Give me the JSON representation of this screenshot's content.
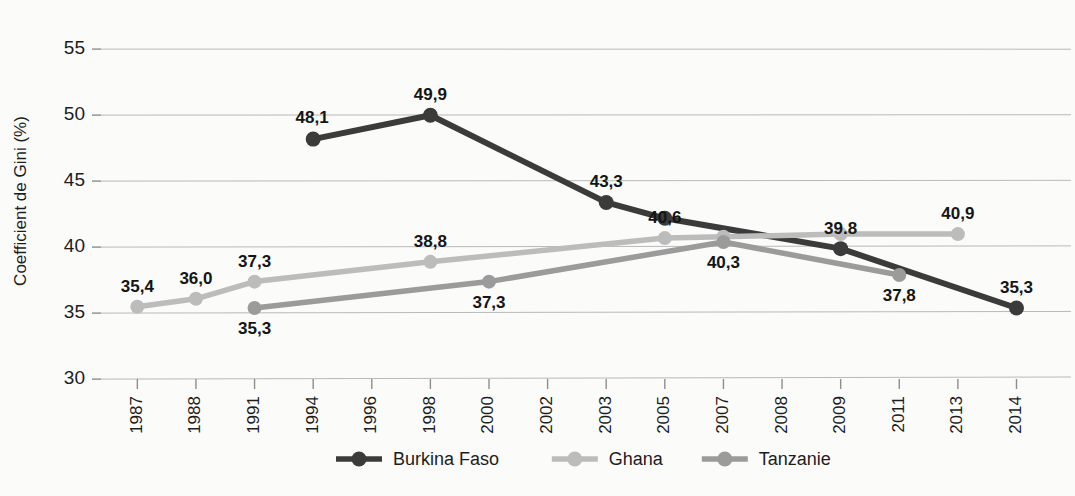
{
  "chart_data": {
    "type": "line",
    "title": "",
    "xlabel": "",
    "ylabel": "Coefficient de Gini (%)",
    "ylim": [
      30,
      55
    ],
    "yticks": [
      30,
      35,
      40,
      45,
      50,
      55
    ],
    "grid": true,
    "legend_position": "bottom",
    "categories": [
      "1987",
      "1988",
      "1991",
      "1994",
      "1996",
      "1998",
      "2000",
      "2002",
      "2003",
      "2005",
      "2007",
      "2008",
      "2009",
      "2011",
      "2013",
      "2014"
    ],
    "series": [
      {
        "name": "Burkina Faso",
        "color": "#3b3b3b",
        "points": [
          {
            "x": "1994",
            "y": 48.1,
            "label": "48,1",
            "label_pos": "above-left"
          },
          {
            "x": "1998",
            "y": 49.9,
            "label": "49,9",
            "label_pos": "above"
          },
          {
            "x": "2003",
            "y": 43.3,
            "label": "43,3",
            "label_pos": "above"
          },
          {
            "x": "2005",
            "y": 42.1,
            "label": "",
            "label_pos": "none"
          },
          {
            "x": "2009",
            "y": 39.8,
            "label": "39.8",
            "label_pos": "above"
          },
          {
            "x": "2014",
            "y": 35.3,
            "label": "35,3",
            "label_pos": "above"
          }
        ]
      },
      {
        "name": "Ghana",
        "color": "#bcbcbc",
        "points": [
          {
            "x": "1987",
            "y": 35.4,
            "label": "35,4",
            "label_pos": "above"
          },
          {
            "x": "1988",
            "y": 36.0,
            "label": "36,0",
            "label_pos": "above"
          },
          {
            "x": "1991",
            "y": 37.3,
            "label": "37,3",
            "label_pos": "above"
          },
          {
            "x": "1998",
            "y": 38.8,
            "label": "38,8",
            "label_pos": "above"
          },
          {
            "x": "2005",
            "y": 40.6,
            "label": "40,6",
            "label_pos": "above"
          },
          {
            "x": "2007",
            "y": 40.7,
            "label": "",
            "label_pos": "none"
          },
          {
            "x": "2009",
            "y": 40.9,
            "label": "",
            "label_pos": "none"
          },
          {
            "x": "2013",
            "y": 40.9,
            "label": "40,9",
            "label_pos": "above"
          }
        ]
      },
      {
        "name": "Tanzanie",
        "color": "#9b9b9b",
        "points": [
          {
            "x": "1991",
            "y": 35.3,
            "label": "35,3",
            "label_pos": "below"
          },
          {
            "x": "2000",
            "y": 37.3,
            "label": "37,3",
            "label_pos": "below"
          },
          {
            "x": "2007",
            "y": 40.3,
            "label": "40,3",
            "label_pos": "below"
          },
          {
            "x": "2011",
            "y": 37.8,
            "label": "37,8",
            "label_pos": "below"
          }
        ]
      }
    ]
  },
  "legend": {
    "items": [
      {
        "label": "Burkina Faso",
        "color": "#3b3b3b"
      },
      {
        "label": "Ghana",
        "color": "#bcbcbc"
      },
      {
        "label": "Tanzanie",
        "color": "#9b9b9b"
      }
    ]
  }
}
